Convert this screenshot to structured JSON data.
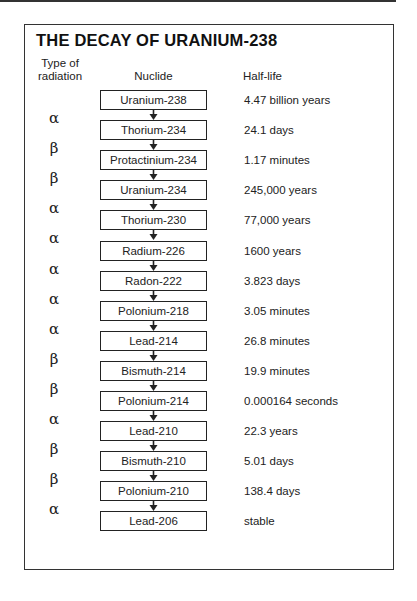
{
  "title": "THE DECAY OF URANIUM-238",
  "headers": {
    "type_line1": "Type of",
    "type_line2": "radiation",
    "nuclide": "Nuclide",
    "half_life": "Half-life"
  },
  "nuclides": [
    {
      "name": "Uranium-238",
      "half_life": "4.47 billion years"
    },
    {
      "name": "Thorium-234",
      "half_life": "24.1 days"
    },
    {
      "name": "Protactinium-234",
      "half_life": "1.17 minutes"
    },
    {
      "name": "Uranium-234",
      "half_life": "245,000 years"
    },
    {
      "name": "Thorium-230",
      "half_life": "77,000 years"
    },
    {
      "name": "Radium-226",
      "half_life": "1600 years"
    },
    {
      "name": "Radon-222",
      "half_life": "3.823 days"
    },
    {
      "name": "Polonium-218",
      "half_life": "3.05 minutes"
    },
    {
      "name": "Lead-214",
      "half_life": "26.8 minutes"
    },
    {
      "name": "Bismuth-214",
      "half_life": "19.9 minutes"
    },
    {
      "name": "Polonium-214",
      "half_life": "0.000164 seconds"
    },
    {
      "name": "Lead-210",
      "half_life": "22.3 years"
    },
    {
      "name": "Bismuth-210",
      "half_life": "5.01 days"
    },
    {
      "name": "Polonium-210",
      "half_life": "138.4 days"
    },
    {
      "name": "Lead-206",
      "half_life": "stable"
    }
  ],
  "radiation": [
    "α",
    "β",
    "β",
    "α",
    "α",
    "α",
    "α",
    "α",
    "β",
    "β",
    "α",
    "β",
    "β",
    "α"
  ]
}
